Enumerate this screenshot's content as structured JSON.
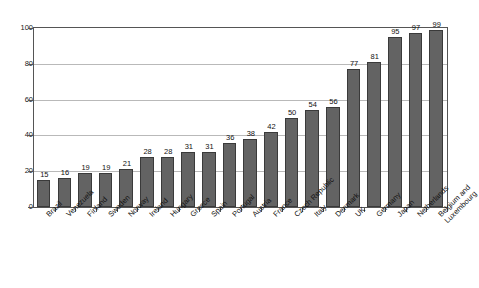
{
  "chart_data": {
    "type": "bar",
    "title": "",
    "subtitle": "",
    "xlabel": "",
    "ylabel": "",
    "ylim": [
      0,
      100
    ],
    "yticks": [
      0,
      20,
      40,
      60,
      80,
      100
    ],
    "grid": true,
    "legend": false,
    "legend_position": "none",
    "orientation": "vertical",
    "bar_color": "#636363",
    "bar_edge_color": "#3a3a3a",
    "gridline_color": "#b9b9b9",
    "frame_color": "#555555",
    "background_color": "#ffffff",
    "data_labels_shown": true,
    "categories": [
      "Brazil",
      "Venezuela",
      "Finland",
      "Sweden",
      "Norway",
      "Ireland",
      "Hungary",
      "Greece",
      "Spain",
      "Portugal",
      "Austria",
      "France",
      "Czech Republic",
      "Italy",
      "Denmark",
      "UK",
      "Germany",
      "Japan",
      "Netherlands",
      "Belgium and Luxembourg"
    ],
    "category_lines": [
      [
        "Brazil"
      ],
      [
        "Venezuela"
      ],
      [
        "Finland"
      ],
      [
        "Sweden"
      ],
      [
        "Norway"
      ],
      [
        "Ireland"
      ],
      [
        "Hungary"
      ],
      [
        "Greece"
      ],
      [
        "Spain"
      ],
      [
        "Portugal"
      ],
      [
        "Austria"
      ],
      [
        "France"
      ],
      [
        "Czech Republic"
      ],
      [
        "Italy"
      ],
      [
        "Denmark"
      ],
      [
        "UK"
      ],
      [
        "Germany"
      ],
      [
        "Japan"
      ],
      [
        "Netherlands"
      ],
      [
        "Belgium and",
        "Luxembourg"
      ]
    ],
    "values": [
      15,
      16,
      19,
      19,
      21,
      28,
      28,
      31,
      31,
      36,
      38,
      42,
      50,
      54,
      56,
      77,
      81,
      95,
      97,
      99
    ]
  }
}
